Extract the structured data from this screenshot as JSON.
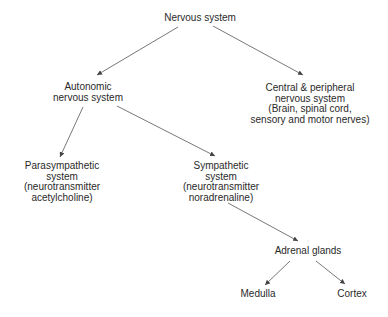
{
  "diagram": {
    "type": "hierarchy",
    "nodes": {
      "nervous_system": {
        "lines": [
          "Nervous system"
        ]
      },
      "autonomic": {
        "lines": [
          "Autonomic",
          "nervous system"
        ]
      },
      "central_peripheral": {
        "lines": [
          "Central & peripheral",
          "nervous system",
          "(Brain, spinal cord,",
          "sensory and motor nerves)"
        ]
      },
      "parasympathetic": {
        "lines": [
          "Parasympathetic",
          "system",
          "(neurotransmitter",
          "acetylcholine)"
        ]
      },
      "sympathetic": {
        "lines": [
          "Sympathetic",
          "system",
          "(neurotransmitter",
          "noradrenaline)"
        ]
      },
      "adrenal_glands": {
        "lines": [
          "Adrenal glands"
        ]
      },
      "medulla": {
        "lines": [
          "Medulla"
        ]
      },
      "cortex": {
        "lines": [
          "Cortex"
        ]
      }
    },
    "edges": [
      {
        "from": "Nervous system",
        "to": "Autonomic nervous system"
      },
      {
        "from": "Nervous system",
        "to": "Central & peripheral nervous system"
      },
      {
        "from": "Autonomic nervous system",
        "to": "Parasympathetic system"
      },
      {
        "from": "Autonomic nervous system",
        "to": "Sympathetic system"
      },
      {
        "from": "Sympathetic system",
        "to": "Adrenal glands"
      },
      {
        "from": "Adrenal glands",
        "to": "Medulla"
      },
      {
        "from": "Adrenal glands",
        "to": "Cortex"
      }
    ],
    "colors": {
      "line": "#444444",
      "text": "#2a2a2a",
      "background": "#ffffff"
    }
  }
}
